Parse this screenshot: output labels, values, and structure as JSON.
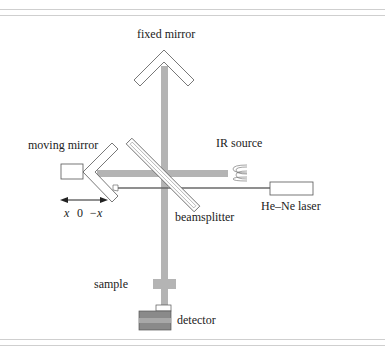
{
  "figure": {
    "labels": {
      "fixed_mirror": "fixed mirror",
      "moving_mirror": "moving mirror",
      "ir_source": "IR source",
      "he_ne_laser": "He–Ne laser",
      "beamsplitter": "beamsplitter",
      "sample": "sample",
      "detector": "detector",
      "axis_x": "x",
      "axis_zero": "0",
      "axis_neg_x": "−x"
    },
    "colors": {
      "ir_beam": "#b4b4b4",
      "laser_beam": "#6a6a6a",
      "outline": "#555555",
      "detector_fill": "#8a8a8a",
      "rule": "#cfcfcf"
    }
  }
}
